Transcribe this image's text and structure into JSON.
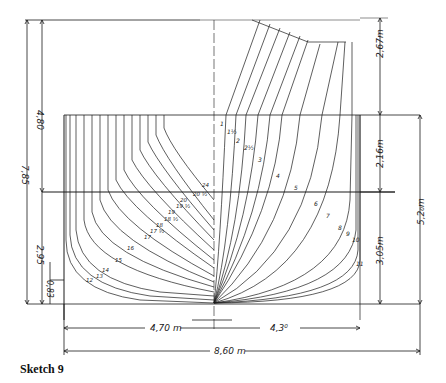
{
  "caption": "Sketch 9",
  "colors": {
    "ink": "#1a1a1a",
    "paper": "#ffffff"
  },
  "dimensions": {
    "total_height_left": "7,85",
    "upper_height_left": "4,80",
    "lower_height_left": "2,95",
    "keel_rise_left": "0,83",
    "top_right": "2,67m",
    "mid_right": "2,16m",
    "lower_right": "3,05m",
    "draft_right": "5,2₀m",
    "half_breadth_left": "4,70 m",
    "half_breadth_right": "4,3⁰",
    "total_breadth": "8,60 m"
  },
  "station_labels_aft": [
    "24",
    "20 ½",
    "20",
    "19 ½",
    "19",
    "18 ½",
    "18",
    "17 ½",
    "17",
    "16",
    "15",
    "14",
    "13",
    "12"
  ],
  "station_labels_fwd": [
    "1",
    "1½",
    "2",
    "2½",
    "3",
    "4",
    "5",
    "6",
    "7",
    "8",
    "9",
    "10",
    "11"
  ]
}
